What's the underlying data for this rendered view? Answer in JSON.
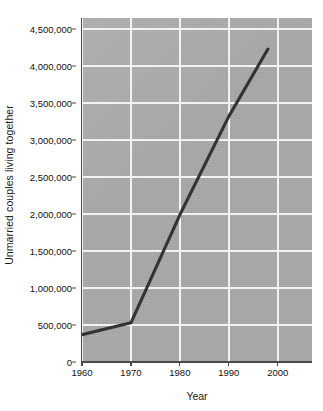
{
  "chart_data": {
    "type": "line",
    "title": "",
    "xlabel": "Year",
    "ylabel": "Unmarried couples living together",
    "xlim": [
      1960,
      2007
    ],
    "ylim": [
      0,
      4650000
    ],
    "grid": true,
    "legend": false,
    "x_ticks": [
      1960,
      1970,
      1980,
      1990,
      2000
    ],
    "x_tick_labels": [
      "1960",
      "1970",
      "1980",
      "1990",
      "2000"
    ],
    "y_ticks": [
      0,
      500000,
      1000000,
      1500000,
      2000000,
      2500000,
      3000000,
      3500000,
      4000000,
      4500000
    ],
    "y_tick_labels": [
      "0",
      "500,000",
      "1,000,000",
      "1,500,000",
      "2,000,000",
      "2,500,000",
      "3,000,000",
      "3,500,000",
      "4,000,000",
      "4,500,000"
    ],
    "series": [
      {
        "name": "Unmarried couples living together",
        "color": "#333333",
        "x": [
          1960,
          1970,
          1980,
          1990,
          1998
        ],
        "values": [
          370000,
          530000,
          1990000,
          3320000,
          4230000
        ]
      }
    ]
  },
  "style": {
    "plot_background": "#a9a9a9",
    "gridline_color": "#f2f2f2",
    "axis_color": "#4a4a4a",
    "line_color": "#333333",
    "page_background": "#ffffff",
    "text_color": "#111111"
  }
}
